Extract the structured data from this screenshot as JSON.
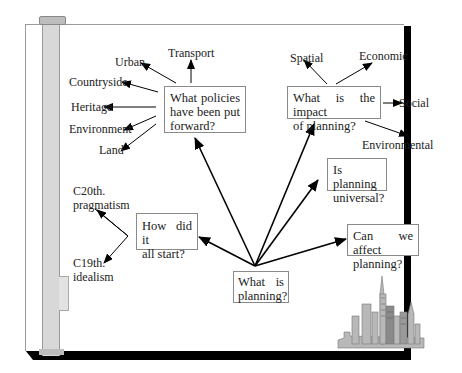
{
  "diagram": {
    "center": {
      "lines": [
        "What  is",
        "planning?"
      ]
    },
    "questions": {
      "policies": {
        "lines": [
          "What  policies",
          "have  been  put",
          "forward?"
        ]
      },
      "impact": {
        "lines": [
          "What  is  the  impact",
          "of  planning?"
        ]
      },
      "universal": {
        "lines": [
          "Is  planning",
          "universal?"
        ]
      },
      "affect": {
        "lines": [
          "Can  we  affect",
          "planning?"
        ]
      },
      "start": {
        "lines": [
          "How  did  it",
          "all  start?"
        ]
      }
    },
    "policy_areas": [
      "Transport",
      "Urban",
      "Countryside",
      "Heritage",
      "Environment",
      "Land"
    ],
    "impact_areas": [
      "Spatial",
      "Economic",
      "Social",
      "Environmental"
    ],
    "origins": [
      {
        "lines": [
          "C20th.",
          "pragmatism"
        ]
      },
      {
        "lines": [
          "C19th.",
          "idealism"
        ]
      }
    ],
    "illustration": "city-skyline"
  }
}
